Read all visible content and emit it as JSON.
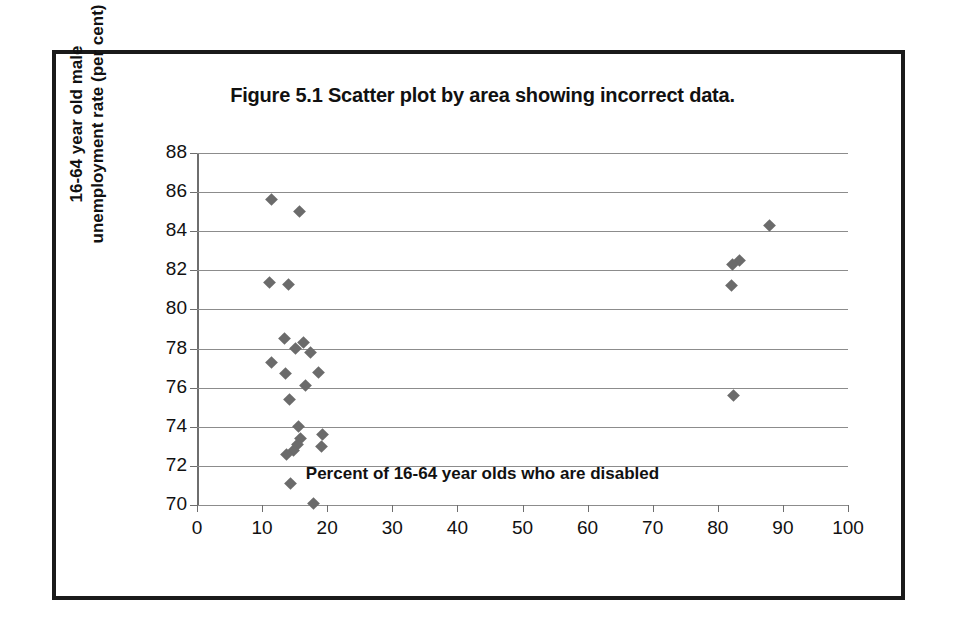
{
  "figure": {
    "title": "Figure 5.1    Scatter plot by area showing incorrect data."
  },
  "chart_data": {
    "type": "scatter",
    "title": "Figure 5.1    Scatter plot by area showing incorrect data.",
    "xlabel": "Percent of 16-64 year olds who are disabled",
    "ylabel": "16-64 year old male\nunemployment rate (per cent)",
    "xlim": [
      0,
      100
    ],
    "ylim": [
      70,
      88
    ],
    "xticks": [
      0,
      10,
      20,
      30,
      40,
      50,
      60,
      70,
      80,
      90,
      100
    ],
    "yticks": [
      70,
      72,
      74,
      76,
      78,
      80,
      82,
      84,
      86,
      88
    ],
    "grid": "horizontal",
    "legend": null,
    "marker": "diamond",
    "marker_color": "#6b6b6b",
    "points": [
      {
        "x": 11.5,
        "y": 85.6
      },
      {
        "x": 15.8,
        "y": 85.0
      },
      {
        "x": 11.2,
        "y": 81.4
      },
      {
        "x": 14.0,
        "y": 81.3
      },
      {
        "x": 13.5,
        "y": 78.5
      },
      {
        "x": 16.3,
        "y": 78.3
      },
      {
        "x": 15.1,
        "y": 78.0
      },
      {
        "x": 17.5,
        "y": 77.8
      },
      {
        "x": 11.4,
        "y": 77.3
      },
      {
        "x": 13.6,
        "y": 76.7
      },
      {
        "x": 18.7,
        "y": 76.8
      },
      {
        "x": 16.6,
        "y": 76.1
      },
      {
        "x": 14.2,
        "y": 75.4
      },
      {
        "x": 15.6,
        "y": 74.0
      },
      {
        "x": 19.3,
        "y": 73.6
      },
      {
        "x": 15.9,
        "y": 73.4
      },
      {
        "x": 15.4,
        "y": 73.1
      },
      {
        "x": 19.2,
        "y": 73.0
      },
      {
        "x": 14.9,
        "y": 72.8
      },
      {
        "x": 13.8,
        "y": 72.6
      },
      {
        "x": 14.3,
        "y": 71.1
      },
      {
        "x": 17.9,
        "y": 70.1
      },
      {
        "x": 87.9,
        "y": 84.3
      },
      {
        "x": 83.4,
        "y": 82.5
      },
      {
        "x": 82.2,
        "y": 82.3
      },
      {
        "x": 82.1,
        "y": 81.2
      },
      {
        "x": 82.4,
        "y": 75.6
      }
    ]
  }
}
